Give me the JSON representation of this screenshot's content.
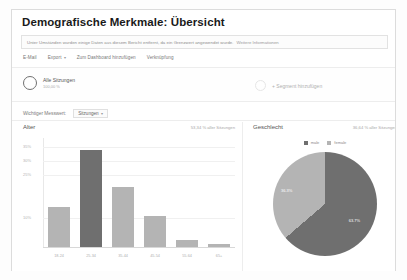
{
  "report": {
    "title": "Demografische Merkmale: Übersicht",
    "notice": "Unter Umständen wurden einige Daten aus diesem Bericht entfernt, da ein Grenzwert angewendet wurde.",
    "notice_link": "Weitere Informationen"
  },
  "toolbar": {
    "email": "E-Mail",
    "export": "Export",
    "export_caret": "▾",
    "add_to_dashboard": "Zum Dashboard hinzufügen",
    "shortcut": "Verknüpfung"
  },
  "segments": {
    "all_sessions_label": "Alle Sitzungen",
    "all_sessions_pct": "100,00 %",
    "add_segment_label": "+ Segment hinzufügen"
  },
  "key_metric": {
    "label": "Wichtiger Messwert:",
    "value": "Sitzungen",
    "caret": "▾"
  },
  "age_panel": {
    "title": "Alter",
    "subtitle": "53,34 % aller Sitzungen"
  },
  "gender_panel": {
    "title": "Geschlecht",
    "subtitle": "36,64 % aller Sitzungen"
  },
  "colors": {
    "bar": "#b4b4b4",
    "bar_highlight": "#6f6f6f",
    "pie_male": "#6f6f6f",
    "pie_female": "#b4b4b4",
    "panel_border": "#dcdcdc"
  },
  "chart_data": [
    {
      "type": "bar",
      "title": "Alter",
      "xlabel": "",
      "ylabel": "",
      "categories": [
        "18-24",
        "25-34",
        "35-44",
        "45-54",
        "55-64",
        "65+"
      ],
      "values": [
        14.0,
        34.0,
        21.0,
        11.0,
        2.5,
        1.0
      ],
      "value_unit": "%",
      "ytick_labels": [
        "35%",
        "30%",
        "25%",
        "10%"
      ],
      "ytick_values": [
        35,
        30,
        25,
        10
      ],
      "ylim": [
        0,
        38
      ],
      "grid": true,
      "legend": "none",
      "highlight_index": 1
    },
    {
      "type": "pie",
      "title": "Geschlecht",
      "labels": [
        "male",
        "female"
      ],
      "values": [
        63.7,
        36.3
      ],
      "value_labels": [
        "63.7%",
        "36.3%"
      ],
      "colors": [
        "#6f6f6f",
        "#b4b4b4"
      ],
      "legend": "top"
    }
  ]
}
